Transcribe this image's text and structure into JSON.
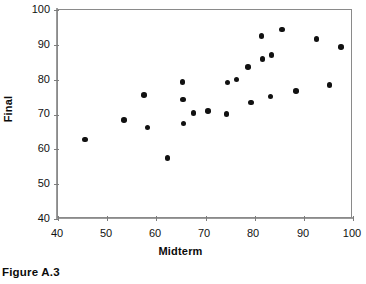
{
  "figure": {
    "caption": "Figure A.3"
  },
  "chart_data": {
    "type": "scatter",
    "title": "",
    "xlabel": "Midterm",
    "ylabel": "Final",
    "xlim": [
      40,
      100
    ],
    "ylim": [
      40,
      100
    ],
    "xticks": [
      40,
      50,
      60,
      70,
      80,
      90,
      100
    ],
    "yticks": [
      40,
      50,
      60,
      70,
      80,
      90,
      100
    ],
    "xtick_labels": [
      "40",
      "50",
      "60",
      "70",
      "80",
      "90",
      "100"
    ],
    "ytick_labels": [
      "40",
      "50",
      "60",
      "70",
      "80",
      "90",
      "100"
    ],
    "grid": false,
    "legend": null,
    "marker": "filled-circle",
    "marker_color": "#111111",
    "axis_color": "#8a8a8a",
    "series": [
      {
        "name": "students",
        "points": [
          [
            45.5,
            62.8
          ],
          [
            53.4,
            68.4
          ],
          [
            57.5,
            75.6
          ],
          [
            58.2,
            66.3
          ],
          [
            62.3,
            57.5
          ],
          [
            65.3,
            79.4
          ],
          [
            65.4,
            74.3
          ],
          [
            65.5,
            67.4
          ],
          [
            67.6,
            70.4
          ],
          [
            70.5,
            71.0
          ],
          [
            74.3,
            70.2
          ],
          [
            74.5,
            79.2
          ],
          [
            76.3,
            80.1
          ],
          [
            78.6,
            83.7
          ],
          [
            79.2,
            73.5
          ],
          [
            81.4,
            92.5
          ],
          [
            81.6,
            85.9
          ],
          [
            83.2,
            75.2
          ],
          [
            83.4,
            87.0
          ],
          [
            85.5,
            94.4
          ],
          [
            88.4,
            76.7
          ],
          [
            92.6,
            91.6
          ],
          [
            95.2,
            78.5
          ],
          [
            97.6,
            89.3
          ]
        ]
      }
    ]
  }
}
